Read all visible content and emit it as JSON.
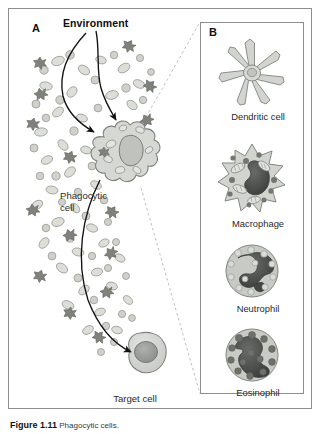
{
  "figure": {
    "panel_a": {
      "letter": "A",
      "environment_label": "Environment",
      "phagocytic_cell_label": "Phagocytic\ncell",
      "target_cell_label": "Target cell"
    },
    "panel_b": {
      "letter": "B",
      "cells": [
        {
          "name": "dendritic-cell",
          "label": "Dendritic cell"
        },
        {
          "name": "macrophage",
          "label": "Macrophage"
        },
        {
          "name": "neutrophil",
          "label": "Neutrophil"
        },
        {
          "name": "eosinophil",
          "label": "Eosinophil"
        }
      ]
    },
    "caption": {
      "number": "Figure 1.11",
      "text": "Phagocytic cells."
    },
    "colors": {
      "frame": "#8e8e8e",
      "cell_fill": "#d2d4d2",
      "cell_stroke": "#8a8c8a",
      "nucleus_dark": "#4a4c4a",
      "nucleus_mid": "#9a9c9a",
      "particle_dark": "#7c7e7c",
      "arrow": "#111111",
      "dashed_guide": "#b4b4b4",
      "text": "#2a2a2a"
    }
  }
}
